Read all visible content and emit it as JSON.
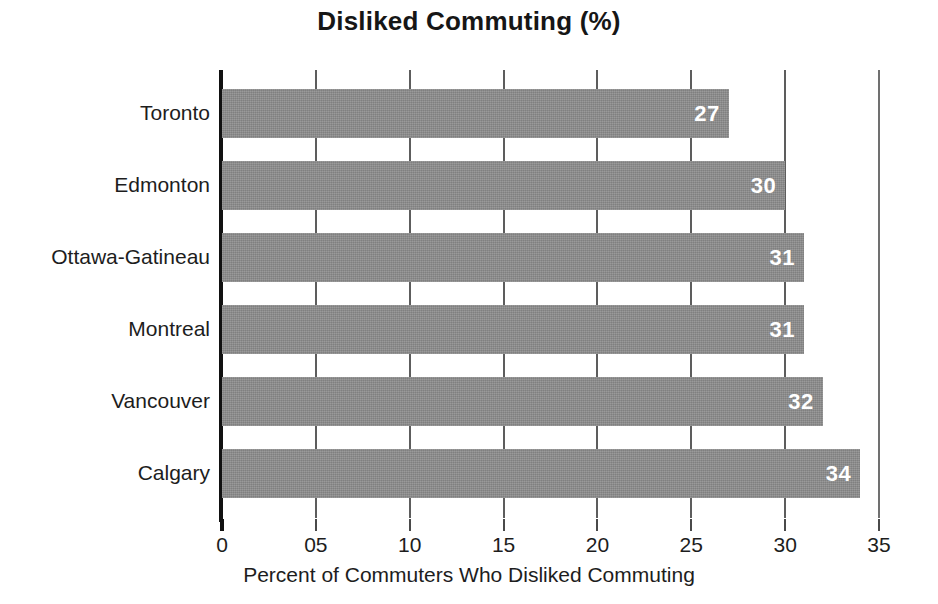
{
  "chart_data": {
    "type": "bar",
    "orientation": "horizontal",
    "title": "Disliked Commuting (%)",
    "xlabel": "Percent of Commuters Who Disliked Commuting",
    "ylabel": "",
    "categories": [
      "Toronto",
      "Edmonton",
      "Ottawa-Gatineau",
      "Montreal",
      "Vancouver",
      "Calgary"
    ],
    "values": [
      27,
      30,
      31,
      31,
      32,
      34
    ],
    "value_labels": [
      "27",
      "30",
      "31",
      "31",
      "32",
      "34"
    ],
    "xlim": [
      0,
      35
    ],
    "xticks": [
      0,
      5,
      10,
      15,
      20,
      25,
      30,
      35
    ],
    "xtick_labels": [
      "0",
      "05",
      "10",
      "15",
      "20",
      "25",
      "30",
      "35"
    ],
    "grid": "vertical",
    "legend": "none",
    "bar_color": "#8e8e8e",
    "value_label_color": "#ffffff",
    "axis_color": "#111111",
    "text_color": "#1d1d1d",
    "background": "#ffffff"
  }
}
